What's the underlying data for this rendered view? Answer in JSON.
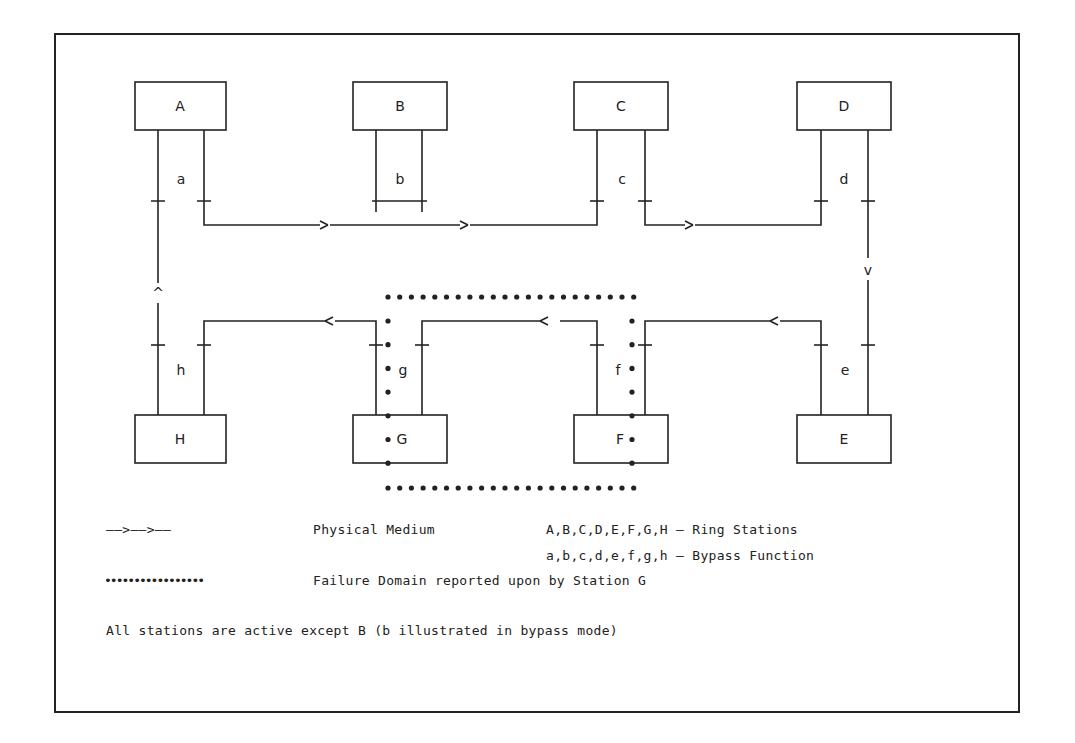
{
  "diagram": {
    "stations": {
      "A": "A",
      "B": "B",
      "C": "C",
      "D": "D",
      "E": "E",
      "F": "F",
      "G": "G",
      "H": "H"
    },
    "bypass": {
      "a": "a",
      "b": "b",
      "c": "c",
      "d": "d",
      "e": "e",
      "f": "f",
      "g": "g",
      "h": "h"
    },
    "arrows": {
      "up": "^",
      "down": "v"
    },
    "colors": {
      "line": "#222222",
      "background": "#ffffff"
    }
  },
  "legend": {
    "physical_medium_symbol": "——>——>——",
    "physical_medium_label": "Physical Medium",
    "ring_stations": "A,B,C,D,E,F,G,H — Ring Stations",
    "bypass_function": "a,b,c,d,e,f,g,h — Bypass Function",
    "failure_domain_symbol": "•••••••••••••••••",
    "failure_domain_label": "Failure Domain reported upon by Station G",
    "note": "All stations are active except B (b illustrated in bypass mode)"
  }
}
